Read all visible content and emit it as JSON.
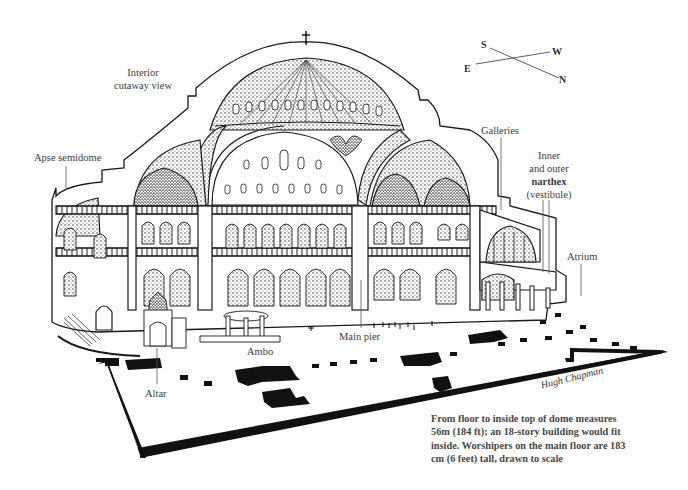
{
  "diagram": {
    "labels": {
      "interior_view": [
        "Interior",
        "cutaway view"
      ],
      "apse_semidome": "Apse semidome",
      "galleries": "Galleries",
      "narthex": [
        "Inner",
        "and outer",
        "narthex",
        "(vestibule)"
      ],
      "atrium": "Atrium",
      "main_pier": "Main pier",
      "ambo": "Ambo",
      "altar": "Altar"
    },
    "compass": {
      "s": "S",
      "w": "W",
      "e": "E",
      "n": "N"
    },
    "caption": [
      "From floor to inside top of dome measures",
      "56m (184 ft); an 18-story building would fit",
      "inside. Worshipers on the main floor are 183",
      "cm (6 feet) tall, drawn to scale"
    ],
    "signature": "Hugh Chapman",
    "colors": {
      "ink": "#1a1a1a",
      "label": "#3d3d3d",
      "paper": "#ffffff",
      "shade": "#6b6b6b"
    }
  }
}
